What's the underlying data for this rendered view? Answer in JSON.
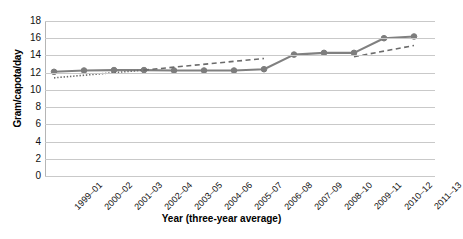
{
  "chart_data": {
    "type": "line",
    "title": "",
    "xlabel": "Year (three-year average)",
    "ylabel": "Gram/capota/day",
    "categories": [
      "1999–01",
      "2000–02",
      "2001–03",
      "2002–04",
      "2003–05",
      "2004–06",
      "2005–07",
      "2006–08",
      "2007–09",
      "2008–10",
      "2009–11",
      "2010–12",
      "2011–13"
    ],
    "values": [
      12.1,
      12.25,
      12.3,
      12.3,
      12.25,
      12.25,
      12.25,
      12.4,
      14.1,
      14.3,
      14.3,
      16.0,
      16.2
    ],
    "ylim": [
      0,
      18
    ],
    "ytick_labels": [
      "18",
      "16",
      "14",
      "12",
      "10",
      "8",
      "6",
      "4",
      "2",
      "0"
    ],
    "ytick_values": [
      18,
      16,
      14,
      12,
      10,
      8,
      6,
      4,
      2,
      0
    ],
    "ystep": 2,
    "grid": true,
    "legend": "none",
    "series": [
      {
        "name": "Gram per capita per day",
        "style": "solid-line-with-round-markers",
        "color": "#808080",
        "values": [
          12.1,
          12.25,
          12.3,
          12.3,
          12.25,
          12.25,
          12.25,
          12.4,
          14.1,
          14.3,
          14.3,
          16.0,
          16.2
        ]
      },
      {
        "name": "Trend segment 1 (dotted)",
        "style": "dotted",
        "color": "#6b6b6b",
        "x_range": [
          "1999–01",
          "2002–04"
        ],
        "y_range": [
          11.4,
          12.3
        ]
      },
      {
        "name": "Trend segment 2 (dashed)",
        "style": "dashed",
        "color": "#6b6b6b",
        "x_range": [
          "2002–04",
          "2006–08"
        ],
        "y_range": [
          12.3,
          13.65
        ]
      },
      {
        "name": "Trend segment 3 (dashed)",
        "style": "dashed",
        "color": "#6b6b6b",
        "x_range": [
          "2009–11",
          "2011–13"
        ],
        "y_range": [
          13.85,
          15.15
        ]
      }
    ]
  },
  "axes": {
    "y_title": "Gram/capota/day",
    "x_title": "Year (three-year average)"
  },
  "style": {
    "line_color": "#808080",
    "marker_color": "#7d7d7d",
    "grid_color": "#c9c9c9",
    "trend_color": "#6b6b6b",
    "background": "#ffffff"
  }
}
